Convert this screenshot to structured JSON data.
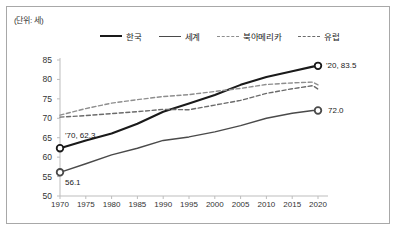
{
  "unit_label": "(단위: 세)",
  "legend": {
    "position": "top-center",
    "items": [
      {
        "label": "한국",
        "style": "solid-thick",
        "color": "#1a1a1a"
      },
      {
        "label": "세계",
        "style": "solid",
        "color": "#4a4a4a"
      },
      {
        "label": "북아메리카",
        "style": "dashed",
        "color": "#8e8e8e"
      },
      {
        "label": "유럽",
        "style": "dashed",
        "color": "#6b6b6b"
      }
    ]
  },
  "annotations": [
    {
      "name": "korea-start",
      "text": "'70, 62.3"
    },
    {
      "name": "world-start",
      "text": "56.1"
    },
    {
      "name": "korea-end",
      "text": "'20, 83.5"
    },
    {
      "name": "world-end",
      "text": "72.0"
    }
  ],
  "chart_data": {
    "type": "line",
    "title": "",
    "subtitle": "",
    "xlabel": "",
    "ylabel": "",
    "unit": "세",
    "xlim": [
      1970,
      2020
    ],
    "ylim": [
      50,
      85
    ],
    "yticks": [
      50,
      55,
      60,
      65,
      70,
      75,
      80,
      85
    ],
    "xticks": [
      1970,
      1975,
      1980,
      1985,
      1990,
      1995,
      2000,
      2005,
      2010,
      2015,
      2020
    ],
    "xtick_labels": [
      "1970",
      "1975",
      "1980",
      "1985",
      "1990",
      "1995",
      "2000",
      "2005",
      "2010",
      "2015",
      "2020"
    ],
    "ytick_labels": [
      "50",
      "55",
      "60",
      "65",
      "70",
      "75",
      "80",
      "85"
    ],
    "grid": false,
    "legend_position": "top-center",
    "x": [
      1970,
      1975,
      1980,
      1985,
      1990,
      1995,
      2000,
      2005,
      2010,
      2015,
      2019,
      2020
    ],
    "series": [
      {
        "name": "한국",
        "style": "solid-thick",
        "color": "#1a1a1a",
        "values": [
          62.3,
          64.3,
          66.1,
          68.6,
          71.7,
          73.8,
          76.0,
          78.6,
          80.6,
          82.1,
          83.3,
          83.5
        ],
        "endpoint_markers": [
          1970,
          2020
        ]
      },
      {
        "name": "세계",
        "style": "solid",
        "color": "#4a4a4a",
        "values": [
          56.1,
          58.3,
          60.6,
          62.3,
          64.3,
          65.2,
          66.5,
          68.1,
          70.0,
          71.3,
          72.0,
          72.0
        ],
        "endpoint_markers": [
          1970,
          2020
        ]
      },
      {
        "name": "북아메리카",
        "style": "dashed",
        "color": "#8e8e8e",
        "values": [
          70.8,
          72.5,
          73.9,
          74.8,
          75.6,
          76.1,
          76.9,
          77.7,
          78.7,
          79.1,
          79.3,
          78.6
        ]
      },
      {
        "name": "유럽",
        "style": "dashed",
        "color": "#6b6b6b",
        "values": [
          70.3,
          70.7,
          71.2,
          71.7,
          72.3,
          72.2,
          73.4,
          74.6,
          76.4,
          77.6,
          78.4,
          77.5
        ]
      }
    ]
  }
}
